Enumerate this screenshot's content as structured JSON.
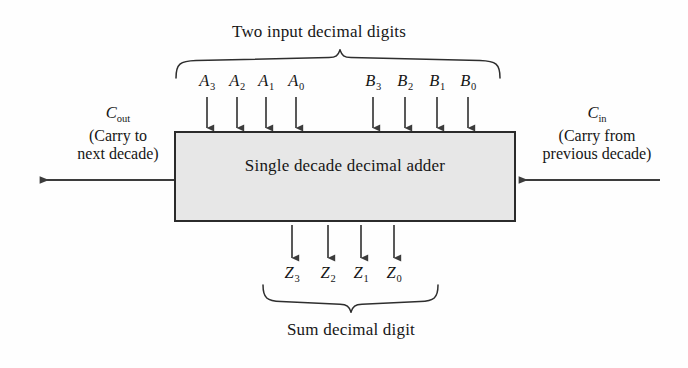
{
  "figure": {
    "title_top": "Two input decimal digits",
    "title_bottom": "Sum decimal digit",
    "block_label": "Single decade decimal adder",
    "colors": {
      "block_fill": "#e7e7e7",
      "block_border": "#2b2b2b",
      "ink": "#161616",
      "page": "#fefefe"
    }
  },
  "inputs": {
    "a_bus": [
      {
        "name": "A",
        "sub": "3"
      },
      {
        "name": "A",
        "sub": "2"
      },
      {
        "name": "A",
        "sub": "1"
      },
      {
        "name": "A",
        "sub": "0"
      }
    ],
    "b_bus": [
      {
        "name": "B",
        "sub": "3"
      },
      {
        "name": "B",
        "sub": "2"
      },
      {
        "name": "B",
        "sub": "1"
      },
      {
        "name": "B",
        "sub": "0"
      }
    ]
  },
  "outputs": {
    "z_bus": [
      {
        "name": "Z",
        "sub": "3"
      },
      {
        "name": "Z",
        "sub": "2"
      },
      {
        "name": "Z",
        "sub": "1"
      },
      {
        "name": "Z",
        "sub": "0"
      }
    ]
  },
  "carry_out": {
    "symbol": "C",
    "subscript": "out",
    "note_line1": "(Carry to",
    "note_line2": "next decade)"
  },
  "carry_in": {
    "symbol": "C",
    "subscript": "in",
    "note_line1": "(Carry from",
    "note_line2": "previous decade)"
  }
}
